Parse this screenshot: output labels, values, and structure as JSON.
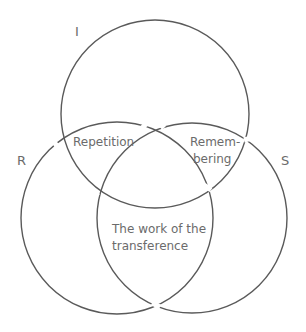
{
  "diagram": {
    "type": "borromean-venn",
    "circles": [
      {
        "id": "I",
        "label": "I",
        "cx": 155,
        "cy": 114,
        "r": 94
      },
      {
        "id": "R",
        "label": "R",
        "cx": 117,
        "cy": 218,
        "r": 96
      },
      {
        "id": "S",
        "label": "S",
        "cx": 192,
        "cy": 218,
        "r": 95
      }
    ],
    "regions": {
      "I_R": {
        "line1": "Repetition"
      },
      "I_S": {
        "line1": "Remem-",
        "line2": "bering"
      },
      "R_S": {
        "line1": "The work of the",
        "line2": "transference"
      }
    },
    "colors": {
      "stroke": "#5a5a5a",
      "text": "#6b6b6b",
      "background": "#ffffff"
    }
  }
}
